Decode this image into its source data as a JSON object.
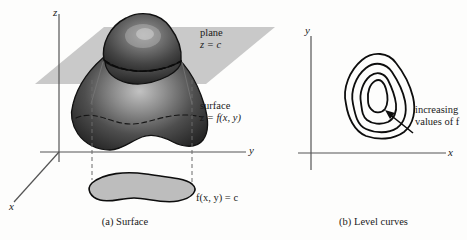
{
  "figure": {
    "panels": [
      {
        "id": "surface",
        "caption": "(a) Surface",
        "axes": {
          "x": "x",
          "y": "y",
          "z": "z"
        },
        "annotations": {
          "plane_label_line1": "plane",
          "plane_label_line2": "z = c",
          "surface_label_line1": "surface",
          "surface_label_line2": "z = f(x, y)",
          "trace_label": "f(x, y) = c"
        }
      },
      {
        "id": "level",
        "caption": "(b) Level curves",
        "axes": {
          "x": "x",
          "y": "y"
        },
        "annotations": {
          "increasing_line1": "increasing",
          "increasing_line2": "values of f"
        }
      }
    ],
    "colors": {
      "plane_fill": "#c9c9c9",
      "surface_dark": "#3a3a3a",
      "surface_light": "#cfcfcf",
      "trace_fill": "#b8b8b8",
      "outline": "#0d0d0d",
      "axis": "#4a4a4a",
      "text": "#1a1a1a"
    }
  }
}
